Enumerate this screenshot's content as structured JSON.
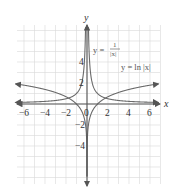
{
  "chart_data": {
    "type": "line",
    "title": "",
    "xlabel": "x",
    "ylabel": "y",
    "xlim": [
      -7,
      7
    ],
    "ylim": [
      -5,
      5
    ],
    "grid": true,
    "x_ticks": [
      -6,
      -4,
      -2,
      0,
      2,
      4,
      6
    ],
    "x_tick_labels": [
      "−6",
      "−4",
      "−2",
      "0",
      "2",
      "4",
      "6"
    ],
    "y_ticks": [
      -4,
      -2,
      2,
      4
    ],
    "y_tick_labels": [
      "−4",
      "−2",
      "2",
      "4"
    ],
    "series": [
      {
        "name": "y = 1/|x|",
        "function": "1/abs(x)",
        "points": [
          [
            -7,
            0.14
          ],
          [
            -6,
            0.17
          ],
          [
            -4,
            0.25
          ],
          [
            -2,
            0.5
          ],
          [
            -1,
            1
          ],
          [
            -0.5,
            2
          ],
          [
            -0.25,
            4
          ],
          [
            0.25,
            4
          ],
          [
            0.5,
            2
          ],
          [
            1,
            1
          ],
          [
            2,
            0.5
          ],
          [
            4,
            0.25
          ],
          [
            6,
            0.17
          ],
          [
            7,
            0.14
          ]
        ]
      },
      {
        "name": "y = ln|x|",
        "function": "ln(abs(x))",
        "points": [
          [
            -7,
            1.95
          ],
          [
            -6,
            1.79
          ],
          [
            -4,
            1.39
          ],
          [
            -2,
            0.69
          ],
          [
            -1,
            0
          ],
          [
            -0.5,
            -0.69
          ],
          [
            -0.1,
            -2.3
          ],
          [
            -0.01,
            -4.6
          ],
          [
            0.01,
            -4.6
          ],
          [
            0.1,
            -2.3
          ],
          [
            0.5,
            -0.69
          ],
          [
            1,
            0
          ],
          [
            2,
            0.69
          ],
          [
            4,
            1.39
          ],
          [
            6,
            1.79
          ],
          [
            7,
            1.95
          ]
        ]
      }
    ],
    "annotations": [
      {
        "text_prefix": "y =",
        "numerator": "1",
        "denominator": "|x|",
        "label": "y = 1/|x|"
      },
      {
        "label": "y = ln |x|"
      }
    ]
  },
  "labels": {
    "x_axis": "x",
    "y_axis": "y",
    "recip_prefix": "y =",
    "recip_num": "1",
    "recip_den": "|x|",
    "ln_label": "y = ln |x|"
  }
}
